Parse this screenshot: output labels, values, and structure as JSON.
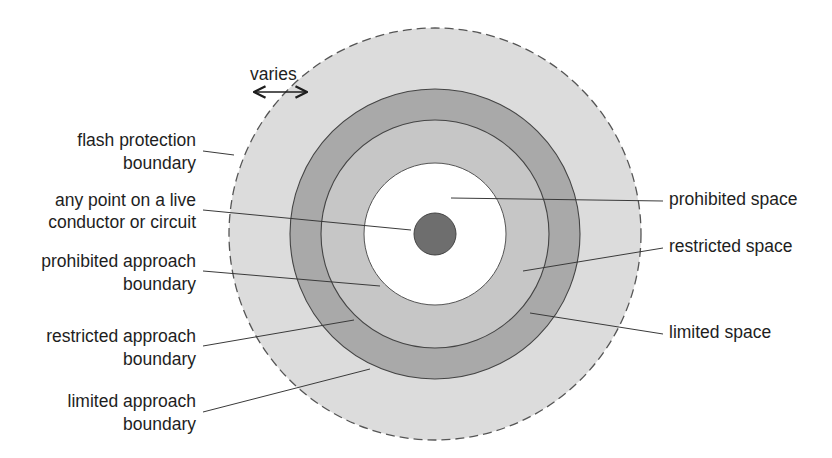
{
  "diagram": {
    "colors": {
      "flash_zone": "#dcdcdc",
      "limited_space": "#a9a9a9",
      "restricted_space": "#c6c6c6",
      "prohibited_space": "#ffffff",
      "conductor": "#6e6e6e",
      "outline": "#555555"
    },
    "varies": {
      "label": "varies",
      "icon": "double-arrow-icon"
    },
    "left_labels": {
      "flash": [
        "flash protection",
        "boundary"
      ],
      "live_point": [
        "any point on a live",
        "conductor or circuit"
      ],
      "prohibited": [
        "prohibited approach",
        "boundary"
      ],
      "restricted": [
        "restricted approach",
        "boundary"
      ],
      "limited": [
        "limited approach",
        "boundary"
      ]
    },
    "right_labels": {
      "prohibited_space": "prohibited space",
      "restricted_space": "restricted space",
      "limited_space": "limited space"
    }
  }
}
